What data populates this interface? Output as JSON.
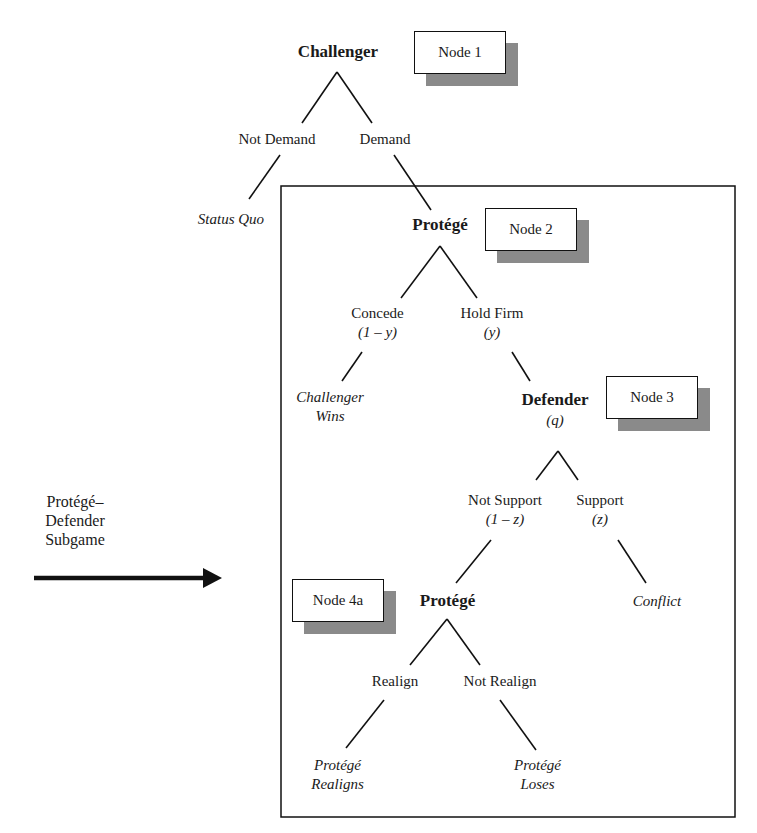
{
  "diagram": {
    "type": "game-tree",
    "nodes": {
      "n1": {
        "player": "Challenger",
        "label": "Node 1"
      },
      "n2": {
        "player": "Protégé",
        "label": "Node 2"
      },
      "n3": {
        "player": "Defender",
        "belief": "(q)",
        "label": "Node 3"
      },
      "n4a": {
        "player": "Protégé",
        "label": "Node 4a"
      }
    },
    "edges": {
      "not_demand": "Not Demand",
      "demand": "Demand",
      "concede": "Concede",
      "concede_prob": "(1 – y)",
      "hold_firm": "Hold Firm",
      "hold_firm_prob": "(y)",
      "not_support": "Not Support",
      "not_support_prob": "(1 – z)",
      "support": "Support",
      "support_prob": "(z)",
      "realign": "Realign",
      "not_realign": "Not Realign"
    },
    "outcomes": {
      "status_quo": "Status Quo",
      "challenger_wins_1": "Challenger",
      "challenger_wins_2": "Wins",
      "conflict": "Conflict",
      "protege_realigns_1": "Protégé",
      "protege_realigns_2": "Realigns",
      "protege_loses_1": "Protégé",
      "protege_loses_2": "Loses"
    },
    "subgame_label": {
      "line1": "Protégé–",
      "line2": "Defender",
      "line3": "Subgame"
    }
  }
}
